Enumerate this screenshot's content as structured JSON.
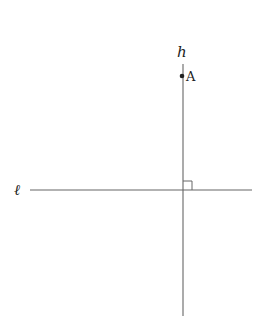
{
  "diagram": {
    "labels": {
      "vertical_line": "h",
      "horizontal_line": "ℓ",
      "point": "A"
    },
    "colors": {
      "line": "#555555",
      "text": "#222222"
    }
  }
}
